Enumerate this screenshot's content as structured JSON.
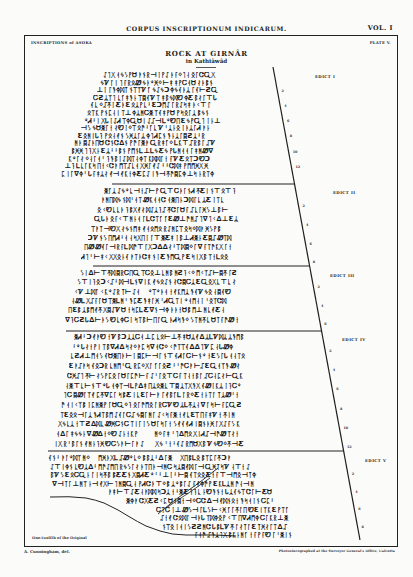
{
  "header": {
    "running_title": "CORPUS INSCRIPTIONUM INDICARUM.",
    "volume": "VOL. I"
  },
  "plate": {
    "series_label": "INSCRIPTIONS of ASOKA",
    "plate_number": "PLATE V.",
    "title": "ROCK AT GIRNÂR",
    "subtitle": "in Kathiâwâd",
    "scale_note": "One-twelfth of the Original"
  },
  "edicts": [
    {
      "label": "EDICT I",
      "line_numbers": [
        "2",
        "4",
        "6",
        "8",
        "10",
        "12"
      ]
    },
    {
      "label": "EDICT II",
      "line_numbers": [
        "2",
        "4",
        "6",
        "8"
      ]
    },
    {
      "label": "EDICT III",
      "line_numbers": [
        "2",
        "4",
        "6"
      ]
    },
    {
      "label": "EDICT IV",
      "line_numbers": [
        "2",
        "4",
        "6",
        "8",
        "10",
        "12"
      ]
    },
    {
      "label": "EDICT V",
      "line_numbers": [
        "2",
        "4",
        "6",
        "8"
      ]
    }
  ],
  "footer": {
    "artist_credit": "A. Cunningham, del.",
    "printer_credit": "Photozincographed at the Surveyor General's Office, Calcutta"
  },
  "script_glyphs": "ᛏᚳᛣᛉᚴᛋᚹᛞᛈᚷᛚᛗᛜᛟᛝᚪᚫᚬᚭᚮᚯᚰᚱᚲᚵᚶᚸᚻᚼᚽᚾᚿᛀᛁᛂᛃᛄᛅᛆᛇᛊᛌᛍᛎᛐᛑᛒᛓᛔᛕᛖᛘᛙᛛᛠᛡᛢᛤᛥᛦ⊥⊢⊣⊤∆∇ƐƆƧƸᏌᏓᏗᏞᏟᏣᏤᏩᏪᏬ"
}
